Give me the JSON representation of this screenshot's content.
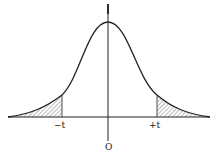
{
  "diagram": {
    "type": "normal-distribution-two-tailed",
    "labels": {
      "left_cut": "−t",
      "right_cut": "+t",
      "origin": "O"
    },
    "colors": {
      "line": "#222222",
      "hatch": "#555555",
      "background": "#ffffff"
    }
  }
}
